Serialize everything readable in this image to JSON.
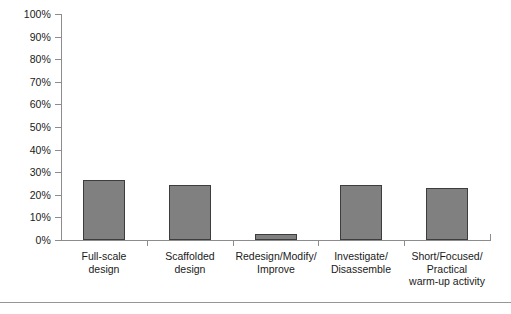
{
  "chart_data": {
    "type": "bar",
    "title": "",
    "subtitle": "",
    "xlabel": "",
    "ylabel": "",
    "ylim": [
      0,
      100
    ],
    "ytick_step": 10,
    "grid": false,
    "legend": false,
    "legend_position": "none",
    "value_unit": "%",
    "bar_color": "#808080",
    "bar_border_color": "#3d3d3d",
    "axis_color": "#8c8c8c",
    "categories": [
      "Full-scale design",
      "Scaffolded design",
      "Redesign/Modify/ Improve",
      "Investigate/ Disassemble",
      "Short/Focused/ Practical warm-up activity"
    ],
    "category_lines": [
      [
        "Full-scale",
        "design"
      ],
      [
        "Scaffolded",
        "design"
      ],
      [
        "Redesign/Modify/",
        "Improve"
      ],
      [
        "Investigate/",
        "Disassemble"
      ],
      [
        "Short/Focused/",
        "Practical",
        "warm-up activity"
      ]
    ],
    "values": [
      26.5,
      24.5,
      2.5,
      24.5,
      23
    ],
    "value_labels": [
      "26.5%",
      "24.5%",
      "2.5%",
      "24.5%",
      "23%"
    ],
    "ytick_labels": [
      "100%",
      "90%",
      "80%",
      "70%",
      "60%",
      "50%",
      "40%",
      "30%",
      "20%",
      "10%",
      "0%"
    ],
    "ytick_values": [
      100,
      90,
      80,
      70,
      60,
      50,
      40,
      30,
      20,
      10,
      0
    ]
  }
}
